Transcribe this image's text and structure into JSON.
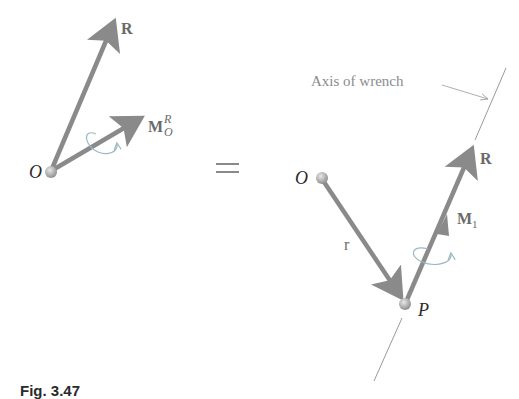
{
  "left_system": {
    "origin_label": "O",
    "force_label": "R",
    "moment_label": "M",
    "moment_superscript": "R",
    "moment_subscript": "O"
  },
  "equals_sign": "=",
  "right_system": {
    "origin_label": "O",
    "point_label": "P",
    "position_vector_label": "r",
    "force_label": "R",
    "moment_label": "M",
    "moment_subscript": "1",
    "axis_label": "Axis of wrench"
  },
  "caption": "Fig. 3.47",
  "colors": {
    "vector": "#8a8a8a",
    "axis_line": "#9a9a9a",
    "moment_curl": "#9ab8c0",
    "point": "#b0b0b0"
  }
}
